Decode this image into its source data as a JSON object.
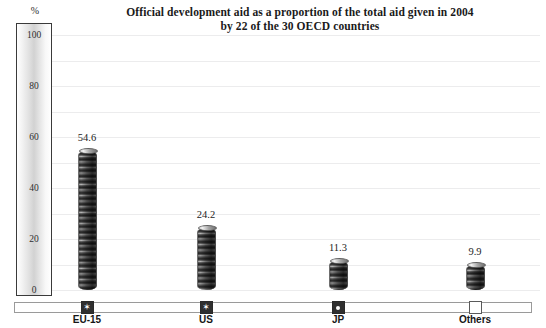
{
  "chart_data": {
    "type": "bar",
    "title": "Official development aid as a proportion of the total aid given in 2004 by 22 of the 30 OECD countries",
    "title_line1": "Official development aid as a proportion of the total aid given in 2004",
    "title_line2": "by 22 of the 30 OECD countries",
    "categories": [
      "EU-15",
      "US",
      "JP",
      "Others"
    ],
    "values": [
      54.6,
      24.2,
      11.3,
      9.9
    ],
    "value_labels": [
      "54.6",
      "24.2",
      "11.3",
      "9.9"
    ],
    "xlabel": "",
    "ylabel": "%",
    "ylim": [
      0,
      100
    ],
    "yticks": [
      100,
      80,
      60,
      40,
      20,
      0
    ],
    "ytick_labels": [
      "100",
      "80",
      "60",
      "40",
      "20",
      "0"
    ],
    "grid": true,
    "grid_step": 10,
    "legend": "none",
    "series": [
      {
        "name": "Share of total aid (%)",
        "values": [
          54.6,
          24.2,
          11.3,
          9.9
        ]
      }
    ],
    "markers": [
      {
        "category": "EU-15",
        "style": "filled-square-star",
        "icon": "star-marker-icon"
      },
      {
        "category": "US",
        "style": "filled-square-star",
        "icon": "star-marker-icon"
      },
      {
        "category": "JP",
        "style": "filled-square-dot",
        "icon": "dot-marker-icon"
      },
      {
        "category": "Others",
        "style": "empty-square",
        "icon": "empty-square-marker-icon"
      }
    ],
    "colors": {
      "background": "#ffffff",
      "bar": "#5a5a5a",
      "gridline": "#ececed",
      "axis_border": "#3a3a3a",
      "text": "#1a1a1a"
    }
  }
}
